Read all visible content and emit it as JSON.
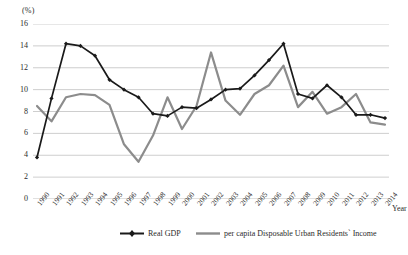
{
  "axis_unit_label": "(%)",
  "x_axis_title": "Year",
  "legend": {
    "series1_label": "Real GDP",
    "series2_label": "per capita Disposable Urban Residents` Income"
  },
  "colors": {
    "series1": "#1a1a1a",
    "series2": "#8c8c8c",
    "gridline": "#b9b9b9",
    "text": "#2b2b2b",
    "background": "#ffffff"
  },
  "chart_data": {
    "type": "line",
    "title": "",
    "xlabel": "Year",
    "ylabel": "(%)",
    "ylim": [
      0,
      16
    ],
    "yticks": [
      0,
      2,
      4,
      6,
      8,
      10,
      12,
      14,
      16
    ],
    "grid": true,
    "legend_position": "bottom",
    "categories": [
      "1990",
      "1991",
      "1992",
      "1993",
      "1994",
      "1995",
      "1996",
      "1997",
      "1998",
      "1999",
      "2000",
      "2001",
      "2002",
      "2003",
      "2004",
      "2005",
      "2006",
      "2007",
      "2008",
      "2009",
      "2010",
      "2011",
      "2012",
      "2013",
      "2014"
    ],
    "series": [
      {
        "name": "Real GDP",
        "color": "#1a1a1a",
        "marker": "diamond",
        "values": [
          3.8,
          9.2,
          14.2,
          14.0,
          13.1,
          10.9,
          10.0,
          9.3,
          7.8,
          7.6,
          8.4,
          8.3,
          9.1,
          10.0,
          10.1,
          11.3,
          12.7,
          14.2,
          9.6,
          9.2,
          10.4,
          9.3,
          7.7,
          7.7,
          7.4
        ]
      },
      {
        "name": "per capita Disposable Urban Residents` Income",
        "color": "#8c8c8c",
        "marker": "none",
        "values": [
          8.5,
          7.1,
          9.3,
          9.6,
          9.5,
          8.6,
          5.0,
          3.4,
          5.8,
          9.3,
          6.4,
          8.5,
          13.4,
          9.0,
          7.7,
          9.6,
          10.4,
          12.2,
          8.4,
          9.8,
          7.8,
          8.4,
          9.6,
          7.0,
          6.8
        ]
      }
    ]
  }
}
